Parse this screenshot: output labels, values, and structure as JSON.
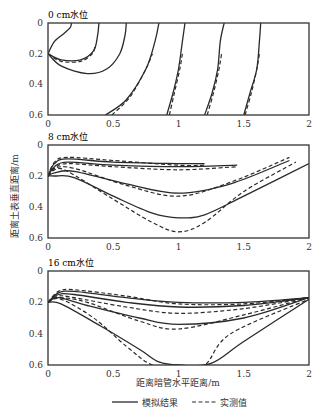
{
  "chart_data": {
    "type": "line",
    "xlabel": "距离暗管水平距离/m",
    "ylabel": "距离土表垂直距离/m",
    "xlim": [
      0,
      2
    ],
    "ylim": [
      0.6,
      0
    ],
    "x_ticks": [
      "0",
      "0.5",
      "1",
      "1.5",
      "2"
    ],
    "y_ticks": [
      "0",
      "0.2",
      "0.4",
      "0.6"
    ],
    "legend": {
      "position": "bottom",
      "entries": [
        {
          "name": "模拟结果",
          "style": "solid"
        },
        {
          "name": "实测值",
          "style": "dashed"
        }
      ]
    },
    "grid": false,
    "panels": [
      {
        "title": "0 cm水位",
        "series": [
          {
            "name": "模拟结果",
            "style": "solid",
            "curves": [
              {
                "x": [
                  0.0,
                  0.05,
                  0.12,
                  0.17,
                  0.18
                ],
                "y": [
                  0.2,
                  0.12,
                  0.07,
                  0.03,
                  0.0
                ]
              },
              {
                "x": [
                  0.0,
                  0.1,
                  0.25,
                  0.35,
                  0.38,
                  0.39
                ],
                "y": [
                  0.2,
                  0.24,
                  0.24,
                  0.18,
                  0.08,
                  0.0
                ]
              },
              {
                "x": [
                  0.0,
                  0.1,
                  0.3,
                  0.45,
                  0.55,
                  0.59,
                  0.6
                ],
                "y": [
                  0.2,
                  0.28,
                  0.33,
                  0.3,
                  0.2,
                  0.08,
                  0.0
                ]
              },
              {
                "x": [
                  0.44,
                  0.6,
                  0.75,
                  0.82,
                  0.85
                ],
                "y": [
                  0.6,
                  0.5,
                  0.3,
                  0.12,
                  0.0
                ]
              },
              {
                "x": [
                  0.91,
                  0.96,
                  1.0,
                  1.03,
                  1.05
                ],
                "y": [
                  0.6,
                  0.45,
                  0.3,
                  0.12,
                  0.0
                ]
              },
              {
                "x": [
                  1.2,
                  1.26,
                  1.3,
                  1.32,
                  1.35
                ],
                "y": [
                  0.6,
                  0.45,
                  0.3,
                  0.12,
                  0.0
                ]
              },
              {
                "x": [
                  1.5,
                  1.55,
                  1.6,
                  1.62,
                  1.63
                ],
                "y": [
                  0.6,
                  0.45,
                  0.3,
                  0.12,
                  0.0
                ]
              }
            ]
          },
          {
            "name": "实测值",
            "style": "dashed",
            "curves": [
              {
                "x": [
                  0.0,
                  0.1,
                  0.25,
                  0.34,
                  0.36
                ],
                "y": [
                  0.2,
                  0.25,
                  0.25,
                  0.2,
                  0.15
                ]
              },
              {
                "x": [
                  0.49,
                  0.63,
                  0.75,
                  0.8
                ],
                "y": [
                  0.6,
                  0.48,
                  0.3,
                  0.2
                ]
              },
              {
                "x": [
                  0.93,
                  0.97,
                  1.01,
                  1.03
                ],
                "y": [
                  0.6,
                  0.45,
                  0.3,
                  0.2
                ]
              },
              {
                "x": [
                  1.22,
                  1.27,
                  1.31,
                  1.33
                ],
                "y": [
                  0.6,
                  0.45,
                  0.3,
                  0.2
                ]
              },
              {
                "x": [
                  1.51,
                  1.56,
                  1.6,
                  1.62
                ],
                "y": [
                  0.6,
                  0.45,
                  0.3,
                  0.2
                ]
              }
            ]
          }
        ]
      },
      {
        "title": "8 cm水位",
        "series": [
          {
            "name": "模拟结果",
            "style": "solid",
            "curves": [
              {
                "x": [
                  0.0,
                  0.05,
                  0.15,
                  0.5,
                  1.0,
                  1.2
                ],
                "y": [
                  0.2,
                  0.12,
                  0.09,
                  0.11,
                  0.12,
                  0.12
                ]
              },
              {
                "x": [
                  0.0,
                  0.05,
                  0.15,
                  0.5,
                  1.0,
                  1.45
                ],
                "y": [
                  0.2,
                  0.14,
                  0.11,
                  0.13,
                  0.14,
                  0.13
                ]
              },
              {
                "x": [
                  0.0,
                  0.05,
                  0.2,
                  0.6,
                  1.0,
                  1.4,
                  1.85
                ],
                "y": [
                  0.2,
                  0.18,
                  0.17,
                  0.25,
                  0.31,
                  0.25,
                  0.1
                ]
              },
              {
                "x": [
                  0.0,
                  0.05,
                  0.2,
                  0.5,
                  0.8,
                  1.0,
                  1.2,
                  1.5,
                  2.0
                ],
                "y": [
                  0.2,
                  0.2,
                  0.21,
                  0.33,
                  0.44,
                  0.47,
                  0.45,
                  0.33,
                  0.12
                ]
              }
            ]
          },
          {
            "name": "实测值",
            "style": "dashed",
            "curves": [
              {
                "x": [
                  0.0,
                  0.05,
                  0.15,
                  0.5,
                  1.0,
                  1.2
                ],
                "y": [
                  0.2,
                  0.11,
                  0.08,
                  0.1,
                  0.13,
                  0.13
                ]
              },
              {
                "x": [
                  0.0,
                  0.05,
                  0.15,
                  0.5,
                  1.0,
                  1.45
                ],
                "y": [
                  0.2,
                  0.15,
                  0.12,
                  0.14,
                  0.16,
                  0.14
                ]
              },
              {
                "x": [
                  0.0,
                  0.05,
                  0.2,
                  0.6,
                  1.0,
                  1.4,
                  1.85
                ],
                "y": [
                  0.2,
                  0.15,
                  0.15,
                  0.26,
                  0.33,
                  0.24,
                  0.08
                ]
              },
              {
                "x": [
                  0.0,
                  0.05,
                  0.15,
                  0.5,
                  0.8,
                  1.0,
                  1.2,
                  1.5,
                  1.9
                ],
                "y": [
                  0.2,
                  0.16,
                  0.17,
                  0.35,
                  0.5,
                  0.56,
                  0.5,
                  0.3,
                  0.11
                ]
              }
            ]
          }
        ]
      },
      {
        "title": "16 cm水位",
        "series": [
          {
            "name": "模拟结果",
            "style": "solid",
            "curves": [
              {
                "x": [
                  0.0,
                  0.08,
                  0.2,
                  0.6,
                  1.0,
                  1.5,
                  2.0
                ],
                "y": [
                  0.2,
                  0.14,
                  0.13,
                  0.17,
                  0.2,
                  0.2,
                  0.17
                ]
              },
              {
                "x": [
                  0.0,
                  0.08,
                  0.2,
                  0.6,
                  1.0,
                  1.5,
                  2.0
                ],
                "y": [
                  0.2,
                  0.15,
                  0.15,
                  0.2,
                  0.23,
                  0.22,
                  0.17
                ]
              },
              {
                "x": [
                  0.0,
                  0.08,
                  0.3,
                  0.7,
                  1.0,
                  1.5,
                  2.0
                ],
                "y": [
                  0.2,
                  0.17,
                  0.22,
                  0.3,
                  0.34,
                  0.3,
                  0.17
                ]
              },
              {
                "x": [
                  0.0,
                  0.1,
                  0.4,
                  0.7,
                  0.85,
                  1.0,
                  1.25,
                  1.5,
                  2.0
                ],
                "y": [
                  0.2,
                  0.21,
                  0.35,
                  0.5,
                  0.58,
                  0.6,
                  0.59,
                  0.45,
                  0.18
                ]
              }
            ]
          },
          {
            "name": "实测值",
            "style": "dashed",
            "curves": [
              {
                "x": [
                  0.0,
                  0.08,
                  0.2,
                  0.6,
                  1.0,
                  1.5,
                  2.0
                ],
                "y": [
                  0.2,
                  0.13,
                  0.12,
                  0.16,
                  0.21,
                  0.21,
                  0.17
                ]
              },
              {
                "x": [
                  0.0,
                  0.08,
                  0.2,
                  0.6,
                  1.0,
                  1.5,
                  2.0
                ],
                "y": [
                  0.2,
                  0.16,
                  0.17,
                  0.23,
                  0.27,
                  0.24,
                  0.17
                ]
              },
              {
                "x": [
                  0.0,
                  0.08,
                  0.3,
                  0.7,
                  1.0,
                  1.5,
                  2.0
                ],
                "y": [
                  0.2,
                  0.17,
                  0.2,
                  0.32,
                  0.37,
                  0.28,
                  0.17
                ]
              },
              {
                "x": [
                  0.0,
                  0.1,
                  0.35,
                  0.6,
                  0.8,
                  1.0,
                  1.2,
                  1.4,
                  2.0
                ],
                "y": [
                  0.2,
                  0.18,
                  0.3,
                  0.48,
                  0.6,
                  0.6,
                  0.6,
                  0.4,
                  0.18
                ]
              }
            ]
          }
        ]
      }
    ]
  }
}
